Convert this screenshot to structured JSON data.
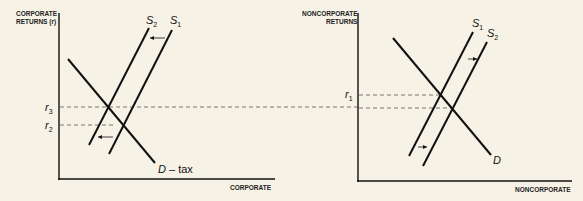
{
  "diagram": {
    "left_panel": {
      "y_axis_title_line1": "CORPORATE",
      "y_axis_title_line2": "RETURNS (r)",
      "x_axis_title": "CORPORATE",
      "curves": {
        "supply_1": {
          "label": "S",
          "sub": "1"
        },
        "supply_2": {
          "label": "S",
          "sub": "2"
        },
        "demand": {
          "label": "D",
          "suffix": " – tax"
        }
      },
      "rate_levels": [
        {
          "label": "r",
          "sub": "3"
        },
        {
          "label": "r",
          "sub": "2"
        }
      ],
      "shift_direction": "left"
    },
    "right_panel": {
      "y_axis_title_line1": "NONCORPORATE",
      "y_axis_title_line2": "RETURNS",
      "x_axis_title": "NONCORPORATE",
      "curves": {
        "supply_1": {
          "label": "S",
          "sub": "1"
        },
        "supply_2": {
          "label": "S",
          "sub": "2"
        },
        "demand": {
          "label": "D"
        }
      },
      "rate_levels": [
        {
          "label": "r",
          "sub": "1"
        }
      ],
      "shift_direction": "right"
    },
    "colors": {
      "background": "#f6f2e6",
      "ink": "#111111",
      "dashed": "#555555"
    }
  }
}
